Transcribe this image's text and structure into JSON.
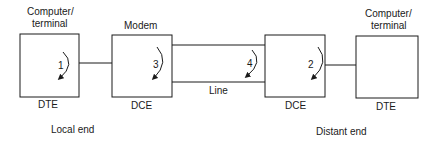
{
  "diagram": {
    "local": {
      "dte": {
        "top_label_1": "Computer/",
        "top_label_2": "terminal",
        "bottom_label": "DTE",
        "loop_number": "1"
      },
      "dce": {
        "top_label": "Modem",
        "bottom_label": "DCE",
        "loop_number": "3"
      },
      "end_label": "Local end"
    },
    "line": {
      "label": "Line",
      "loop_number": "4"
    },
    "distant": {
      "dce": {
        "bottom_label": "DCE",
        "loop_number": "2"
      },
      "dte": {
        "top_label_1": "Computer/",
        "top_label_2": "terminal",
        "bottom_label": "DTE"
      },
      "end_label": "Distant end"
    },
    "colors": {
      "stroke": "#1a1a1a",
      "background": "#ffffff"
    }
  }
}
